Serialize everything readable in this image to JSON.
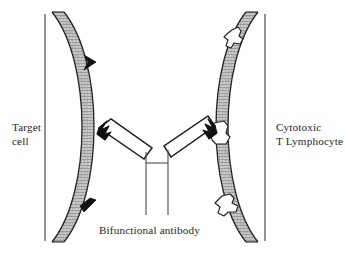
{
  "figure": {
    "background_color": "#ffffff",
    "ink_color": "#1a1a1a",
    "membrane_fill": "#b3b3b3"
  },
  "labels": {
    "target_cell_line1": "Target",
    "target_cell_line2": "cell",
    "lymphocyte_line1": "Cytotoxic",
    "lymphocyte_line2": "T Lymphocyte",
    "antibody": "Bifunctional antibody"
  },
  "elements": {
    "target_cell_name": "target-cell",
    "lymphocyte_name": "cytotoxic-t-lymphocyte",
    "antibody_name": "bifunctional-antibody",
    "antigen_name": "target-cell-antigen",
    "receptor_name": "t-cell-surface-receptor"
  },
  "counts": {
    "antigens_on_target_cell": 2,
    "receptors_on_lymphocyte": 2,
    "antibody_binding_arms": 2
  }
}
